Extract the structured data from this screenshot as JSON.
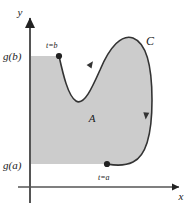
{
  "figure": {
    "type": "math-diagram",
    "background_color": "#ffffff",
    "shade_color": "#cccccc",
    "stroke_color": "#333333"
  },
  "axes": {
    "x_label": "x",
    "y_label": "y",
    "x_axis": {
      "y_pixel": 187,
      "x_start": 30,
      "x_end": 182
    },
    "y_axis": {
      "x_pixel": 30,
      "y_start": 16,
      "y_end": 203
    },
    "arrow_marker": "arrowhead"
  },
  "tick_labels": [
    {
      "name": "g-of-b",
      "text": "g(b)",
      "x": 3,
      "y": 60,
      "value_pixel_y": 56
    },
    {
      "name": "g-of-a",
      "text": "g(a)",
      "x": 3,
      "y": 169,
      "value_pixel_y": 165
    }
  ],
  "points": [
    {
      "name": "point-t-equals-b",
      "label": "t=b",
      "px": 59,
      "py": 56,
      "label_x": 46,
      "label_y": 48
    },
    {
      "name": "point-t-equals-a",
      "label": "t=a",
      "px": 107,
      "py": 164,
      "label_x": 98,
      "label_y": 180
    }
  ],
  "labels": {
    "region": "A",
    "curve": "C",
    "region_x": 92,
    "region_y": 122,
    "curve_x": 150,
    "curve_y": 45
  },
  "direction_arrows": [
    {
      "name": "direction-arrow-upper-left",
      "x": 91,
      "y": 64,
      "angle": -55
    },
    {
      "name": "direction-arrow-right-side",
      "x": 146,
      "y": 116,
      "angle": 95
    }
  ],
  "curve_path": "M 59 56 C 63 74, 68 96, 76 101 C 84 106, 92 88, 100 70 C 110 46, 122 34, 133 38 C 146 43, 152 66, 152 100 C 152 134, 146 156, 133 162 C 123 167, 113 165, 107 164",
  "shaded_region_path": "M 30 56 L 59 56 C 63 74, 68 96, 76 101 C 84 106, 92 88, 100 70 C 110 46, 122 34, 133 38 C 146 43, 152 66, 152 100 C 152 134, 146 156, 133 162 C 123 167, 113 165, 107 164 L 30 164 Z"
}
